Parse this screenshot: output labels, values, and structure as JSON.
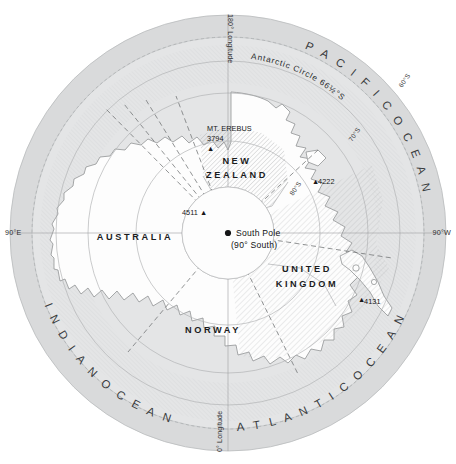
{
  "map": {
    "projection_center": "South Pole",
    "claims": [
      {
        "id": "australia",
        "label": "AUSTRALIA",
        "x": 135,
        "y": 240
      },
      {
        "id": "new-zealand",
        "label": "NEW ZEALAND",
        "line1": "NEW",
        "line2": "ZEALAND",
        "x": 237,
        "y": 168
      },
      {
        "id": "norway",
        "label": "NORWAY",
        "x": 213,
        "y": 333
      },
      {
        "id": "united-kingdom",
        "label": "UNITED KINGDOM",
        "line1": "UNITED",
        "line2": "KINGDOM",
        "x": 307,
        "y": 275
      }
    ],
    "oceans": [
      {
        "id": "pacific",
        "label": "PACIFIC OCEAN",
        "letters": "P A C I F I C   O C E A N"
      },
      {
        "id": "indian",
        "label": "INDIAN OCEAN",
        "letters": "I N D I A N   O C E A N"
      },
      {
        "id": "atlantic",
        "label": "ATLANTIC OCEAN",
        "letters": "A T L A N T I C   O C E A N"
      }
    ],
    "longitude_labels": [
      {
        "id": "lon-180",
        "label": "180° Longitude",
        "position": "top"
      },
      {
        "id": "lon-0",
        "label": "0° Longitude",
        "position": "bottom"
      },
      {
        "id": "lon-90e",
        "label": "90°E",
        "position": "left"
      },
      {
        "id": "lon-90w",
        "label": "90°W",
        "position": "right"
      }
    ],
    "latitude_labels": [
      {
        "id": "lat-60",
        "label": "60°S"
      },
      {
        "id": "lat-70",
        "label": "70°S"
      },
      {
        "id": "lat-80",
        "label": "80°S"
      }
    ],
    "antarctic_circle": {
      "id": "antarctic-circle",
      "label": "Antarctic Circle 66½°S"
    },
    "pole": {
      "id": "south-pole",
      "name": "South Pole",
      "coordinate": "(90° South)"
    },
    "peaks": [
      {
        "id": "mt-erebus",
        "name": "MT. EREBUS",
        "elevation": "3794",
        "marker": "▲",
        "x": 207,
        "y": 128
      },
      {
        "id": "peak-4511",
        "name": "",
        "elevation": "4511",
        "marker": "▲",
        "x": 198,
        "y": 212
      },
      {
        "id": "peak-4222",
        "name": "",
        "elevation": "4222",
        "marker": "▲",
        "x": 312,
        "y": 181
      },
      {
        "id": "peak-4131",
        "name": "",
        "elevation": "4131",
        "marker": "▲",
        "x": 358,
        "y": 299
      }
    ],
    "colors": {
      "ocean_outer": "#d9dadb",
      "ocean_inner": "#e4e5e6",
      "land": "#fdfdfd",
      "graticule": "#9d9fa1",
      "claim_boundary": "#6e7072",
      "text": "#1b1c1d",
      "background": "#ffffff"
    }
  }
}
